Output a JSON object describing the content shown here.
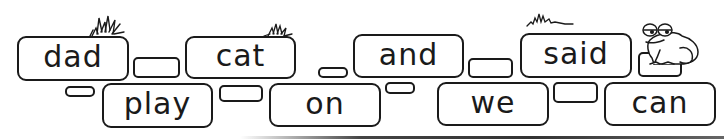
{
  "activity": {
    "type": "word-brick-path",
    "words_top_row": [
      "dad",
      "cat",
      "and",
      "said"
    ],
    "words_bottom_row": [
      "play",
      "on",
      "we",
      "can"
    ]
  },
  "bricks": {
    "top": [
      {
        "word": "dad",
        "x": 17,
        "y": 36,
        "w": 112,
        "h": 45
      },
      {
        "word": "cat",
        "x": 185,
        "y": 36,
        "w": 111,
        "h": 43
      },
      {
        "word": "and",
        "x": 353,
        "y": 34,
        "w": 111,
        "h": 44
      },
      {
        "word": "said",
        "x": 520,
        "y": 33,
        "w": 112,
        "h": 45
      }
    ],
    "bottom": [
      {
        "word": "play",
        "x": 102,
        "y": 83,
        "w": 111,
        "h": 45
      },
      {
        "word": "on",
        "x": 269,
        "y": 83,
        "w": 112,
        "h": 44
      },
      {
        "word": "we",
        "x": 437,
        "y": 82,
        "w": 112,
        "h": 44
      },
      {
        "word": "can",
        "x": 604,
        "y": 82,
        "w": 112,
        "h": 44
      }
    ]
  },
  "decorations": {
    "grass_tufts": 3,
    "frog": "frog-on-brick",
    "ground_line": true
  },
  "colors": {
    "outline": "#1a1a1a",
    "background": "#ffffff"
  }
}
